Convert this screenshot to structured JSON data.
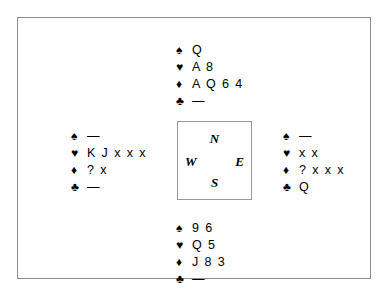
{
  "diagram": {
    "type": "bridge-deal-diagram",
    "suit_symbols": {
      "spade": "♠",
      "heart": "♥",
      "diamond": "♦",
      "club": "♣"
    },
    "void_marker": "—",
    "compass": {
      "north": "N",
      "west": "W",
      "east": "E",
      "south": "S"
    },
    "hands": {
      "north": {
        "spades": "Q",
        "hearts": "A 8",
        "diamonds": "A Q 6 4",
        "clubs": "—"
      },
      "west": {
        "spades": "—",
        "hearts": "K J x x x",
        "diamonds": "? x",
        "clubs": "—"
      },
      "east": {
        "spades": "—",
        "hearts": "x x",
        "diamonds": "? x x x",
        "clubs": "Q"
      },
      "south": {
        "spades": "9 6",
        "hearts": "Q 5",
        "diamonds": "J 8 3",
        "clubs": "—"
      }
    }
  }
}
